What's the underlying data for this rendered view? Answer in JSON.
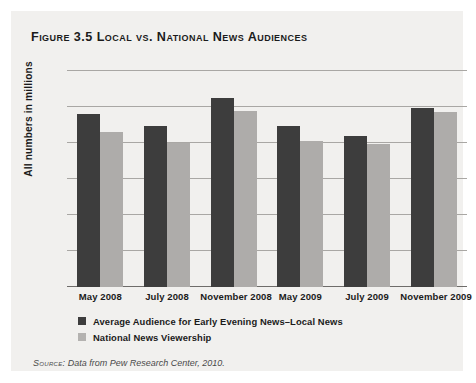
{
  "figure": {
    "title": "Figure 3.5 Local vs. National News Audiences",
    "source_label": "Source:",
    "source_text": " Data from Pew Research Center, 2010.",
    "panel_background": "#f1f0ee"
  },
  "chart_data": {
    "type": "bar",
    "title": "Figure 3.5 Local vs. National News Audiences",
    "xlabel": "",
    "ylabel": "All numbers in millions",
    "ylim": [
      0,
      30
    ],
    "yticks": [
      0,
      5,
      10,
      15,
      20,
      25,
      30
    ],
    "ytick_labels": [
      "0",
      "5",
      "10",
      "15",
      "20",
      "25",
      "30"
    ],
    "grid": true,
    "legend_position": "below-axes-left",
    "categories": [
      "May 2008",
      "July 2008",
      "November 2008",
      "May 2009",
      "July 2009",
      "November 2009"
    ],
    "series": [
      {
        "name": "Average Audience for Early Evening News–Local News",
        "color": "#3d3d3d",
        "values": [
          24.0,
          22.3,
          26.3,
          22.4,
          21.0,
          24.9
        ]
      },
      {
        "name": "National News Viewership",
        "color": "#aeacaa",
        "values": [
          21.5,
          20.0,
          24.4,
          20.3,
          19.9,
          24.3
        ]
      }
    ],
    "annotations": [],
    "source": "Source: Data from Pew Research Center, 2010."
  }
}
